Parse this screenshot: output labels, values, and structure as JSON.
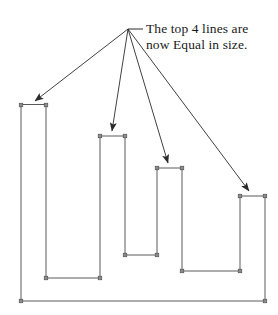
{
  "figure": {
    "background_color": "#ffffff",
    "stroke_color": "#5a5a5a",
    "arrow_color": "#2b2b2b",
    "handle_color": "#8c8c8c",
    "handle_border_color": "#4a4a4a",
    "text_color": "#1a1a1a",
    "stroke_width": 1
  },
  "caption": {
    "line1": "The top 4 lines are",
    "line2": "now Equal in size.",
    "anchor_point": {
      "x": 128,
      "y": 29
    },
    "leader_end": {
      "x": 143,
      "y": 29
    }
  },
  "chart_data": {
    "type": "line",
    "title": "The top 4 lines are now Equal in size.",
    "xlabel": "",
    "ylabel": "",
    "grid": false,
    "legend": null,
    "categories": [
      "Line 1",
      "Line 2",
      "Line 3",
      "Line 4"
    ],
    "values": [
      25,
      25,
      25,
      25
    ],
    "units": "px",
    "note": "All four top horizontal segments measure 25 px wide (equal length).",
    "top_segments": [
      {
        "label": "Line 1",
        "x1": 21,
        "x2": 46,
        "y": 105,
        "length": 25
      },
      {
        "label": "Line 2",
        "x1": 100,
        "x2": 125,
        "y": 136,
        "length": 25
      },
      {
        "label": "Line 3",
        "x1": 157,
        "x2": 182,
        "y": 168,
        "length": 25
      },
      {
        "label": "Line 4",
        "x1": 240,
        "x2": 265,
        "y": 196,
        "length": 25
      }
    ],
    "valley_segments": [
      {
        "x1": 46,
        "x2": 100,
        "y": 278
      },
      {
        "x1": 125,
        "x2": 157,
        "y": 255
      },
      {
        "x1": 182,
        "x2": 240,
        "y": 271
      }
    ],
    "baseline": {
      "x1": 21,
      "x2": 265,
      "y": 301
    },
    "outline_path": "M 21 105 L 21 301 L 265 301 L 265 196 L 240 196 L 240 271 L 182 271 L 182 168 L 157 168 L 157 255 L 125 255 L 125 136 L 100 136 L 100 278 L 46 278 L 46 105 Z",
    "arrows": [
      {
        "target": "Line 1",
        "from": {
          "x": 128,
          "y": 29
        },
        "to": {
          "x": 35,
          "y": 101
        }
      },
      {
        "target": "Line 2",
        "from": {
          "x": 128,
          "y": 29
        },
        "to": {
          "x": 112,
          "y": 131
        }
      },
      {
        "target": "Line 3",
        "from": {
          "x": 128,
          "y": 29
        },
        "to": {
          "x": 168,
          "y": 163
        }
      },
      {
        "target": "Line 4",
        "from": {
          "x": 128,
          "y": 29
        },
        "to": {
          "x": 249,
          "y": 191
        }
      }
    ],
    "handles": [
      {
        "x": 21,
        "y": 105
      },
      {
        "x": 46,
        "y": 105
      },
      {
        "x": 100,
        "y": 136
      },
      {
        "x": 125,
        "y": 136
      },
      {
        "x": 157,
        "y": 168
      },
      {
        "x": 182,
        "y": 168
      },
      {
        "x": 240,
        "y": 196
      },
      {
        "x": 265,
        "y": 196
      },
      {
        "x": 21,
        "y": 301
      },
      {
        "x": 265,
        "y": 301
      },
      {
        "x": 46,
        "y": 278
      },
      {
        "x": 100,
        "y": 278
      },
      {
        "x": 125,
        "y": 255
      },
      {
        "x": 157,
        "y": 255
      },
      {
        "x": 182,
        "y": 271
      },
      {
        "x": 240,
        "y": 271
      }
    ]
  }
}
